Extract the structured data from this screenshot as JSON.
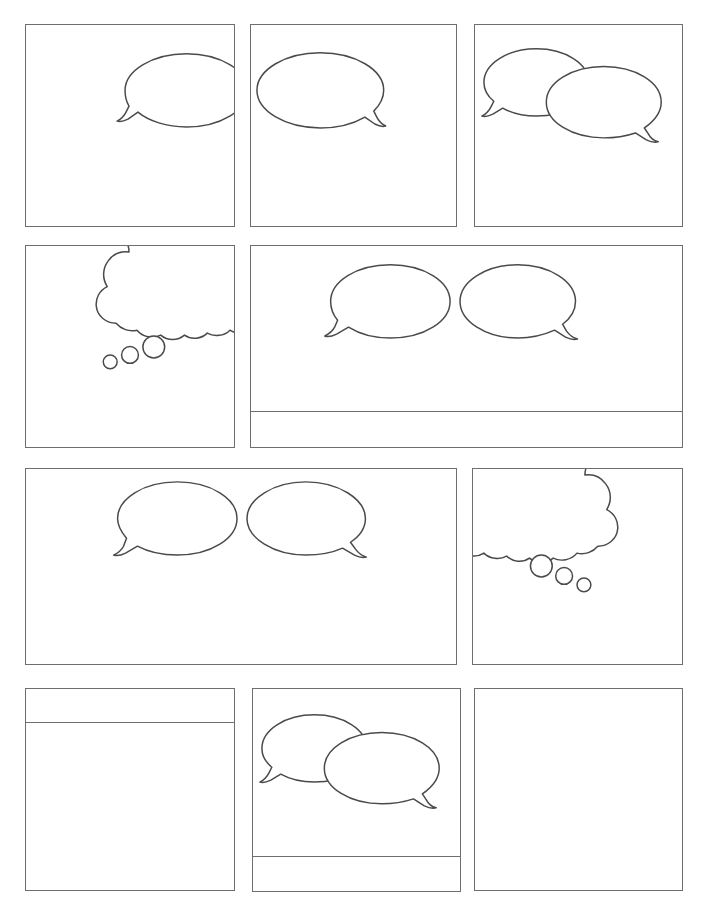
{
  "page": {
    "kind": "comic-page-template",
    "width": 706,
    "height": 906,
    "background_color": "#ffffff",
    "panel_border_color": "#6e6e6e",
    "bubble_stroke_color": "#4a4a4a",
    "bubble_fill_color": "#ffffff",
    "title": "",
    "rows": 4,
    "panel_count": 10
  },
  "rows": [
    {
      "index": 1,
      "panels": [
        {
          "id": "panel-1",
          "label": "",
          "x": 25,
          "y": 24,
          "width": 210,
          "height": 203,
          "caption": null,
          "balloons": [
            {
              "type": "speech-balloon",
              "tail": "down-left",
              "cx": 162,
              "cy": 66,
              "rx": 62,
              "ry": 37
            }
          ]
        },
        {
          "id": "panel-2",
          "label": "",
          "x": 250,
          "y": 24,
          "width": 207,
          "height": 203,
          "caption": null,
          "balloons": [
            {
              "type": "speech-balloon",
              "tail": "down-right",
              "cx": 70,
              "cy": 66,
              "rx": 64,
              "ry": 38
            }
          ]
        },
        {
          "id": "panel-3",
          "label": "",
          "x": 474,
          "y": 24,
          "width": 209,
          "height": 203,
          "caption": null,
          "balloons": [
            {
              "type": "speech-balloon",
              "tail": "down-left",
              "cx": 62,
              "cy": 58,
              "rx": 53,
              "ry": 34
            },
            {
              "type": "speech-balloon",
              "tail": "down-right",
              "cx": 130,
              "cy": 78,
              "rx": 58,
              "ry": 36
            }
          ]
        }
      ]
    },
    {
      "index": 2,
      "panels": [
        {
          "id": "panel-4",
          "label": "",
          "x": 25,
          "y": 245,
          "width": 210,
          "height": 203,
          "caption": null,
          "balloons": [
            {
              "type": "thought-balloon",
              "tail": "down-left-dots",
              "orientation": "clipped-top-right"
            }
          ]
        },
        {
          "id": "panel-5",
          "label": "",
          "x": 250,
          "y": 245,
          "width": 433,
          "height": 203,
          "caption": {
            "position": "bottom",
            "divider_y": 165,
            "text": ""
          },
          "balloons": [
            {
              "type": "speech-balloon",
              "tail": "down-left",
              "cx": 140,
              "cy": 56,
              "rx": 60,
              "ry": 37
            },
            {
              "type": "speech-balloon",
              "tail": "down-right",
              "cx": 268,
              "cy": 56,
              "rx": 58,
              "ry": 37
            }
          ]
        }
      ]
    },
    {
      "index": 3,
      "panels": [
        {
          "id": "panel-6",
          "label": "",
          "x": 25,
          "y": 468,
          "width": 432,
          "height": 197,
          "caption": null,
          "balloons": [
            {
              "type": "speech-balloon",
              "tail": "down-left",
              "cx": 152,
              "cy": 50,
              "rx": 62,
              "ry": 37
            },
            {
              "type": "speech-balloon",
              "tail": "down-right",
              "cx": 281,
              "cy": 50,
              "rx": 60,
              "ry": 37
            }
          ]
        },
        {
          "id": "panel-7",
          "label": "",
          "x": 472,
          "y": 468,
          "width": 211,
          "height": 197,
          "caption": null,
          "balloons": [
            {
              "type": "thought-balloon",
              "tail": "down-right-dots",
              "orientation": "clipped-top-left"
            }
          ]
        }
      ]
    },
    {
      "index": 4,
      "panels": [
        {
          "id": "panel-8",
          "label": "",
          "x": 25,
          "y": 688,
          "width": 210,
          "height": 203,
          "caption": {
            "position": "top",
            "divider_y": 34,
            "text": ""
          },
          "balloons": []
        },
        {
          "id": "panel-9",
          "label": "",
          "x": 252,
          "y": 688,
          "width": 209,
          "height": 204,
          "caption": {
            "position": "bottom",
            "divider_y": 167,
            "text": ""
          },
          "balloons": [
            {
              "type": "speech-balloon",
              "tail": "down-left",
              "cx": 62,
              "cy": 60,
              "rx": 53,
              "ry": 34
            },
            {
              "type": "speech-balloon",
              "tail": "down-right",
              "cx": 130,
              "cy": 80,
              "rx": 57,
              "ry": 36
            }
          ]
        },
        {
          "id": "panel-10",
          "label": "",
          "x": 474,
          "y": 688,
          "width": 209,
          "height": 203,
          "caption": null,
          "balloons": []
        }
      ]
    }
  ]
}
